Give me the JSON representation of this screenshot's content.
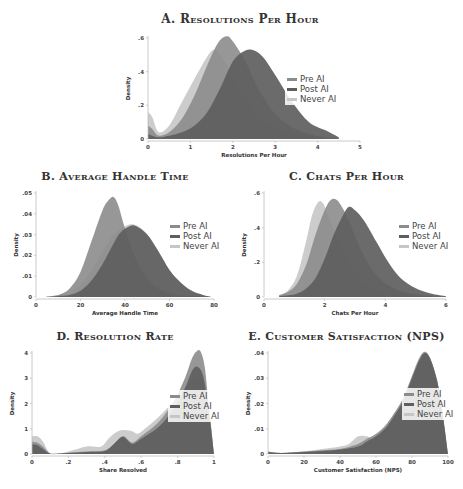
{
  "colors": {
    "pre_ai": "#8c8c8c",
    "post_ai": "#5e5e5e",
    "never_ai": "#c6c6c6",
    "axis": "#bdbdbd"
  },
  "legend": [
    "Pre AI",
    "Post AI",
    "Never AI"
  ],
  "chart_data": [
    {
      "id": "A",
      "type": "area",
      "title": "A. Resolutions Per Hour",
      "xlabel": "Resolutions Per Hour",
      "ylabel": "Density",
      "xlim": [
        0,
        5
      ],
      "ylim": [
        0,
        0.6
      ],
      "xticks": [
        0,
        1,
        2,
        3,
        4,
        5
      ],
      "xtick_labels": [
        "0",
        "1",
        "2",
        "3",
        "4",
        "5"
      ],
      "yticks": [
        0,
        0.2,
        0.4,
        0.6
      ],
      "ytick_labels": [
        "0",
        ".2",
        ".4",
        ".6"
      ],
      "legend_position": "right",
      "series": [
        {
          "name": "Never AI",
          "x": [
            0,
            0.1,
            0.25,
            0.5,
            0.8,
            1.1,
            1.4,
            1.55,
            1.7,
            2.0,
            2.3,
            2.6,
            3.0,
            3.4,
            3.8,
            4.2,
            4.5
          ],
          "y": [
            0.16,
            0.13,
            0.04,
            0.08,
            0.22,
            0.36,
            0.49,
            0.53,
            0.5,
            0.38,
            0.24,
            0.13,
            0.06,
            0.03,
            0.015,
            0.005,
            0
          ]
        },
        {
          "name": "Pre AI",
          "x": [
            0,
            0.1,
            0.25,
            0.5,
            0.8,
            1.1,
            1.4,
            1.65,
            1.85,
            2.0,
            2.3,
            2.6,
            3.0,
            3.4,
            3.8,
            4.2,
            4.5
          ],
          "y": [
            0.08,
            0.06,
            0.02,
            0.04,
            0.12,
            0.26,
            0.44,
            0.57,
            0.61,
            0.58,
            0.46,
            0.3,
            0.15,
            0.07,
            0.03,
            0.01,
            0
          ]
        },
        {
          "name": "Post AI",
          "x": [
            0,
            0.1,
            0.25,
            0.5,
            0.8,
            1.1,
            1.4,
            1.7,
            2.0,
            2.25,
            2.45,
            2.7,
            3.0,
            3.4,
            3.8,
            4.2,
            4.5
          ],
          "y": [
            0.03,
            0.02,
            0.01,
            0.02,
            0.04,
            0.08,
            0.16,
            0.3,
            0.46,
            0.52,
            0.53,
            0.49,
            0.38,
            0.22,
            0.1,
            0.05,
            0.01
          ]
        }
      ]
    },
    {
      "id": "B",
      "type": "area",
      "title": "B. Average Handle Time",
      "xlabel": "Average Handle Time",
      "ylabel": "Density",
      "xlim": [
        0,
        80
      ],
      "ylim": [
        0,
        0.05
      ],
      "xticks": [
        0,
        20,
        40,
        60,
        80
      ],
      "xtick_labels": [
        "0",
        "20",
        "40",
        "60",
        "80"
      ],
      "yticks": [
        0,
        0.01,
        0.02,
        0.03,
        0.04,
        0.05
      ],
      "ytick_labels": [
        "0",
        ".01",
        ".02",
        ".03",
        ".04",
        ".05"
      ],
      "legend_position": "right",
      "series": [
        {
          "name": "Never AI",
          "x": [
            4,
            10,
            15,
            20,
            25,
            30,
            35,
            40,
            43,
            46,
            50,
            55,
            60,
            65,
            70,
            75,
            79
          ],
          "y": [
            0,
            0.001,
            0.002,
            0.006,
            0.013,
            0.022,
            0.03,
            0.034,
            0.035,
            0.034,
            0.03,
            0.022,
            0.013,
            0.007,
            0.003,
            0.001,
            0
          ]
        },
        {
          "name": "Pre AI",
          "x": [
            4,
            10,
            15,
            20,
            25,
            30,
            33,
            35,
            37,
            40,
            45,
            50,
            55,
            60,
            65,
            70,
            79
          ],
          "y": [
            0,
            0.001,
            0.004,
            0.012,
            0.027,
            0.042,
            0.047,
            0.048,
            0.044,
            0.033,
            0.018,
            0.009,
            0.004,
            0.002,
            0.001,
            0.0005,
            0
          ]
        },
        {
          "name": "Post AI",
          "x": [
            4,
            10,
            15,
            20,
            25,
            30,
            35,
            38,
            42,
            45,
            50,
            55,
            60,
            65,
            70,
            75,
            79
          ],
          "y": [
            0,
            0.0005,
            0.001,
            0.003,
            0.008,
            0.016,
            0.026,
            0.031,
            0.034,
            0.034,
            0.03,
            0.022,
            0.013,
            0.007,
            0.003,
            0.001,
            0
          ]
        }
      ]
    },
    {
      "id": "C",
      "type": "area",
      "title": "C. Chats Per Hour",
      "xlabel": "Chats Per Hour",
      "ylabel": "Density",
      "xlim": [
        0,
        6
      ],
      "ylim": [
        0,
        0.6
      ],
      "xticks": [
        0,
        2,
        4,
        6
      ],
      "xtick_labels": [
        "0",
        "2",
        "4",
        "6"
      ],
      "yticks": [
        0,
        0.2,
        0.4,
        0.6
      ],
      "ytick_labels": [
        "0",
        ".2",
        ".4",
        ".6"
      ],
      "legend_position": "right",
      "series": [
        {
          "name": "Never AI",
          "x": [
            0.5,
            0.8,
            1.1,
            1.4,
            1.6,
            1.8,
            1.95,
            2.1,
            2.4,
            2.8,
            3.2,
            3.6,
            4.0,
            4.5,
            5.0,
            5.5,
            6.0
          ],
          "y": [
            0.01,
            0.04,
            0.13,
            0.33,
            0.48,
            0.55,
            0.54,
            0.48,
            0.35,
            0.2,
            0.1,
            0.05,
            0.02,
            0.01,
            0.005,
            0.002,
            0
          ]
        },
        {
          "name": "Pre AI",
          "x": [
            0.5,
            0.8,
            1.1,
            1.4,
            1.7,
            2.0,
            2.2,
            2.4,
            2.6,
            2.9,
            3.2,
            3.6,
            4.0,
            4.5,
            5.0,
            5.5,
            6.0
          ],
          "y": [
            0.01,
            0.03,
            0.08,
            0.19,
            0.36,
            0.5,
            0.56,
            0.56,
            0.51,
            0.4,
            0.27,
            0.15,
            0.08,
            0.035,
            0.015,
            0.006,
            0
          ]
        },
        {
          "name": "Post AI",
          "x": [
            0.5,
            0.8,
            1.1,
            1.4,
            1.7,
            2.0,
            2.3,
            2.6,
            2.8,
            3.0,
            3.3,
            3.7,
            4.1,
            4.5,
            5.0,
            5.5,
            6.0
          ],
          "y": [
            0.005,
            0.01,
            0.02,
            0.05,
            0.11,
            0.22,
            0.36,
            0.47,
            0.52,
            0.5,
            0.44,
            0.32,
            0.2,
            0.11,
            0.05,
            0.02,
            0.005
          ]
        }
      ]
    },
    {
      "id": "D",
      "type": "area",
      "title": "D. Resolution Rate",
      "xlabel": "Share Resolved",
      "ylabel": "Density",
      "xlim": [
        0,
        1
      ],
      "ylim": [
        0,
        4
      ],
      "xticks": [
        0,
        0.2,
        0.4,
        0.6,
        0.8,
        1
      ],
      "xtick_labels": [
        "0",
        ".2",
        ".4",
        ".6",
        ".8",
        "1"
      ],
      "yticks": [
        0,
        1,
        2,
        3,
        4
      ],
      "ytick_labels": [
        "0",
        "1",
        "2",
        "3",
        "4"
      ],
      "legend_position": "right",
      "series": [
        {
          "name": "Never AI",
          "x": [
            0,
            0.03,
            0.06,
            0.1,
            0.15,
            0.2,
            0.25,
            0.3,
            0.38,
            0.42,
            0.46,
            0.5,
            0.55,
            0.58,
            0.62,
            0.7,
            0.78,
            0.84,
            0.88,
            0.92,
            0.96,
            1.0
          ],
          "y": [
            0.7,
            0.7,
            0.5,
            0.02,
            0.02,
            0.1,
            0.2,
            0.3,
            0.3,
            0.6,
            0.85,
            0.95,
            0.9,
            0.8,
            1.0,
            1.5,
            2.1,
            2.6,
            2.9,
            3.0,
            2.6,
            0
          ]
        },
        {
          "name": "Pre AI",
          "x": [
            0,
            0.03,
            0.06,
            0.1,
            0.15,
            0.2,
            0.3,
            0.4,
            0.45,
            0.5,
            0.55,
            0.6,
            0.7,
            0.78,
            0.84,
            0.88,
            0.91,
            0.93,
            0.95,
            0.97,
            1.0
          ],
          "y": [
            0.5,
            0.45,
            0.3,
            0.02,
            0.02,
            0.05,
            0.1,
            0.15,
            0.4,
            0.7,
            0.45,
            0.7,
            1.3,
            2.1,
            3.0,
            3.8,
            4.1,
            4.0,
            3.4,
            2.0,
            0
          ]
        },
        {
          "name": "Post AI",
          "x": [
            0,
            0.03,
            0.06,
            0.1,
            0.15,
            0.2,
            0.3,
            0.4,
            0.45,
            0.5,
            0.55,
            0.6,
            0.7,
            0.78,
            0.84,
            0.88,
            0.91,
            0.94,
            0.97,
            1.0
          ],
          "y": [
            0.4,
            0.35,
            0.2,
            0.02,
            0.02,
            0.04,
            0.08,
            0.12,
            0.4,
            0.68,
            0.4,
            0.6,
            1.1,
            1.8,
            2.6,
            3.3,
            3.45,
            3.1,
            1.8,
            0
          ]
        }
      ]
    },
    {
      "id": "E",
      "type": "area",
      "title": "E. Customer Satisfaction (NPS)",
      "xlabel": "Customer Satisfaction (NPS)",
      "ylabel": "Density",
      "xlim": [
        0,
        100
      ],
      "ylim": [
        0,
        0.04
      ],
      "xticks": [
        0,
        20,
        40,
        60,
        80,
        100
      ],
      "xtick_labels": [
        "0",
        "20",
        "40",
        "60",
        "80",
        "100"
      ],
      "yticks": [
        0,
        0.01,
        0.02,
        0.03,
        0.04
      ],
      "ytick_labels": [
        "0",
        ".01",
        ".02",
        ".03",
        ".04"
      ],
      "legend_position": "right",
      "series": [
        {
          "name": "Never AI",
          "x": [
            0,
            5,
            10,
            20,
            30,
            40,
            45,
            50,
            55,
            58,
            62,
            66,
            70,
            75,
            80,
            84,
            87,
            90,
            94,
            97,
            100
          ],
          "y": [
            0.001,
            0.0005,
            0.0005,
            0.001,
            0.002,
            0.003,
            0.004,
            0.007,
            0.007,
            0.006,
            0.009,
            0.012,
            0.016,
            0.022,
            0.03,
            0.037,
            0.039,
            0.037,
            0.028,
            0.015,
            0
          ]
        },
        {
          "name": "Pre AI",
          "x": [
            0,
            5,
            10,
            20,
            30,
            40,
            50,
            55,
            60,
            65,
            70,
            75,
            80,
            84,
            87,
            90,
            94,
            97,
            100
          ],
          "y": [
            0.001,
            0.0005,
            0.0005,
            0.001,
            0.0015,
            0.002,
            0.004,
            0.006,
            0.008,
            0.011,
            0.016,
            0.022,
            0.031,
            0.038,
            0.0405,
            0.038,
            0.029,
            0.016,
            0
          ]
        },
        {
          "name": "Post AI",
          "x": [
            0,
            5,
            10,
            20,
            30,
            40,
            50,
            55,
            60,
            65,
            70,
            75,
            80,
            84,
            87,
            90,
            94,
            97,
            100
          ],
          "y": [
            0.0008,
            0.0004,
            0.0004,
            0.0008,
            0.0012,
            0.0018,
            0.003,
            0.005,
            0.007,
            0.01,
            0.015,
            0.021,
            0.03,
            0.037,
            0.04,
            0.038,
            0.029,
            0.016,
            0
          ]
        }
      ]
    }
  ]
}
